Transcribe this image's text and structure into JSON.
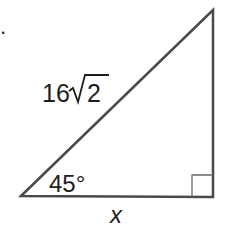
{
  "figure": {
    "problem_marker": ".",
    "hypotenuse_label": "16",
    "hypotenuse_radicand": "2",
    "angle_label": "45°",
    "base_label": "x",
    "right_angle_marker": true,
    "colors": {
      "stroke": "#4a4a4a",
      "text": "#1e1e1e"
    }
  }
}
